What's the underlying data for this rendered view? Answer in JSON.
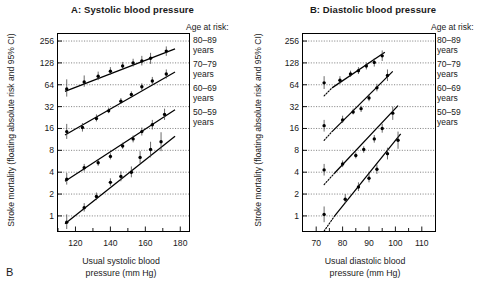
{
  "figure": {
    "corner_label": "B",
    "y_axis_title": "Stroke mortality (floating absolute risk and 95% CI)",
    "y_ticks": [
      "1",
      "2",
      "4",
      "8",
      "16",
      "32",
      "64",
      "128",
      "256"
    ],
    "legend_heading": "Age at risk:",
    "legend_entries": [
      {
        "range": "80–89",
        "unit": "years"
      },
      {
        "range": "70–79",
        "unit": "years"
      },
      {
        "range": "60–69",
        "unit": "years"
      },
      {
        "range": "50–59",
        "unit": "years"
      }
    ]
  },
  "panel_a": {
    "title": "A: Systolic blood pressure",
    "x_axis_title_line1": "Usual systolic blood",
    "x_axis_title_line2": "pressure (mm Hg)",
    "x_ticks": [
      "120",
      "140",
      "160",
      "180"
    ]
  },
  "panel_b": {
    "title": "B: Diastolic blood pressure",
    "x_axis_title_line1": "Usual diastolic blood",
    "x_axis_title_line2": "pressure (mm Hg)",
    "x_ticks": [
      "70",
      "80",
      "90",
      "100",
      "110"
    ]
  },
  "chart_data": {
    "type": "scatter",
    "ylabel": "Stroke mortality (floating absolute risk and 95% CI)",
    "y_scale": "log2",
    "ylim": [
      0.62,
      320
    ],
    "y_ticks": [
      1,
      2,
      4,
      8,
      16,
      32,
      64,
      128,
      256
    ],
    "grid": "horizontal-dotted",
    "legend_position": "right-outside",
    "legend_title": "Age at risk:",
    "panels": [
      {
        "id": "A",
        "title": "A: Systolic blood pressure",
        "xlabel": "Usual systolic blood pressure (mm Hg)",
        "xlim": [
          110,
          185
        ],
        "x_ticks": [
          120,
          140,
          160,
          180
        ],
        "x_minor_ticks": [
          110,
          130,
          150,
          170
        ],
        "series": [
          {
            "name": "80–89 years",
            "fit_line": {
              "x0": 114,
              "y0": 52,
              "x1": 177,
              "y1": 200
            },
            "points": [
              {
                "x": 115,
                "y": 56,
                "ci_low": 44,
                "ci_high": 76
              },
              {
                "x": 125,
                "y": 70,
                "ci_low": 60,
                "ci_high": 86
              },
              {
                "x": 133,
                "y": 84,
                "ci_low": 74,
                "ci_high": 97
              },
              {
                "x": 140,
                "y": 98,
                "ci_low": 88,
                "ci_high": 112
              },
              {
                "x": 147,
                "y": 116,
                "ci_low": 104,
                "ci_high": 132
              },
              {
                "x": 153,
                "y": 128,
                "ci_low": 114,
                "ci_high": 146
              },
              {
                "x": 158,
                "y": 136,
                "ci_low": 118,
                "ci_high": 160
              },
              {
                "x": 163,
                "y": 148,
                "ci_low": 124,
                "ci_high": 176
              },
              {
                "x": 172,
                "y": 186,
                "ci_low": 160,
                "ci_high": 216
              }
            ]
          },
          {
            "name": "70–79 years",
            "fit_line": {
              "x0": 114,
              "y0": 13,
              "x1": 177,
              "y1": 96
            },
            "points": [
              {
                "x": 115,
                "y": 14.5,
                "ci_low": 11.5,
                "ci_high": 18.5
              },
              {
                "x": 124,
                "y": 16.5,
                "ci_low": 14.5,
                "ci_high": 19
              },
              {
                "x": 132,
                "y": 22,
                "ci_low": 20,
                "ci_high": 25
              },
              {
                "x": 139,
                "y": 28,
                "ci_low": 26,
                "ci_high": 31
              },
              {
                "x": 146,
                "y": 38,
                "ci_low": 35,
                "ci_high": 42
              },
              {
                "x": 152,
                "y": 47,
                "ci_low": 43,
                "ci_high": 52
              },
              {
                "x": 158,
                "y": 60,
                "ci_low": 54,
                "ci_high": 67
              },
              {
                "x": 164,
                "y": 72,
                "ci_low": 64,
                "ci_high": 82
              },
              {
                "x": 172,
                "y": 90,
                "ci_low": 78,
                "ci_high": 104
              }
            ]
          },
          {
            "name": "60–69 years",
            "fit_line": {
              "x0": 114,
              "y0": 3.0,
              "x1": 177,
              "y1": 29
            },
            "points": [
              {
                "x": 115,
                "y": 3.2,
                "ci_low": 2.7,
                "ci_high": 3.9
              },
              {
                "x": 125,
                "y": 4.6,
                "ci_low": 4.1,
                "ci_high": 5.2
              },
              {
                "x": 133,
                "y": 5.4,
                "ci_low": 4.9,
                "ci_high": 6.0
              },
              {
                "x": 140,
                "y": 6.6,
                "ci_low": 6.0,
                "ci_high": 7.3
              },
              {
                "x": 147,
                "y": 9.2,
                "ci_low": 8.4,
                "ci_high": 10.2
              },
              {
                "x": 153,
                "y": 11.5,
                "ci_low": 10.3,
                "ci_high": 12.8
              },
              {
                "x": 158,
                "y": 14.5,
                "ci_low": 12.8,
                "ci_high": 16.5
              },
              {
                "x": 164,
                "y": 18,
                "ci_low": 15.5,
                "ci_high": 21
              },
              {
                "x": 171,
                "y": 25,
                "ci_low": 21,
                "ci_high": 30
              }
            ]
          },
          {
            "name": "50–59 years",
            "fit_line": {
              "x0": 114,
              "y0": 0.78,
              "x1": 177,
              "y1": 12.5
            },
            "points": [
              {
                "x": 115,
                "y": 0.82,
                "ci_low": 0.66,
                "ci_high": 1.05
              },
              {
                "x": 125,
                "y": 1.3,
                "ci_low": 1.15,
                "ci_high": 1.5
              },
              {
                "x": 132,
                "y": 1.85,
                "ci_low": 1.65,
                "ci_high": 2.1
              },
              {
                "x": 140,
                "y": 2.9,
                "ci_low": 2.6,
                "ci_high": 3.3
              },
              {
                "x": 146,
                "y": 3.5,
                "ci_low": 3.0,
                "ci_high": 4.1
              },
              {
                "x": 152,
                "y": 4.0,
                "ci_low": 3.4,
                "ci_high": 4.8
              },
              {
                "x": 157,
                "y": 6.4,
                "ci_low": 5.3,
                "ci_high": 7.8
              },
              {
                "x": 163,
                "y": 8.2,
                "ci_low": 6.4,
                "ci_high": 10.5
              },
              {
                "x": 169,
                "y": 10.5,
                "ci_low": 7.8,
                "ci_high": 14.2
              }
            ]
          }
        ]
      },
      {
        "id": "B",
        "title": "B: Diastolic blood pressure",
        "xlabel": "Usual diastolic blood pressure (mm Hg)",
        "xlim": [
          65,
          115
        ],
        "x_ticks": [
          70,
          80,
          90,
          100,
          110
        ],
        "x_minor_ticks": [
          75,
          85,
          95,
          105
        ],
        "series": [
          {
            "name": "80–89 years",
            "fit_line": {
              "x0": 76,
              "y0": 58,
              "x1": 96,
              "y1": 180
            },
            "dotted_extension": {
              "x0": 73,
              "y0": 45,
              "x1": 76,
              "y1": 58
            },
            "points": [
              {
                "x": 73,
                "y": 68,
                "ci_low": 56,
                "ci_high": 84
              },
              {
                "x": 79,
                "y": 74,
                "ci_low": 66,
                "ci_high": 84
              },
              {
                "x": 83,
                "y": 90,
                "ci_low": 82,
                "ci_high": 100
              },
              {
                "x": 86,
                "y": 100,
                "ci_low": 90,
                "ci_high": 112
              },
              {
                "x": 89,
                "y": 116,
                "ci_low": 104,
                "ci_high": 130
              },
              {
                "x": 92,
                "y": 130,
                "ci_low": 114,
                "ci_high": 148
              },
              {
                "x": 95,
                "y": 160,
                "ci_low": 136,
                "ci_high": 190
              }
            ]
          },
          {
            "name": "70–79 years",
            "fit_line": {
              "x0": 76,
              "y0": 14.5,
              "x1": 99,
              "y1": 98
            },
            "dotted_extension": {
              "x0": 73,
              "y0": 11,
              "x1": 76,
              "y1": 14.5
            },
            "points": [
              {
                "x": 73,
                "y": 17.5,
                "ci_low": 14.5,
                "ci_high": 21
              },
              {
                "x": 80,
                "y": 21,
                "ci_low": 19,
                "ci_high": 24
              },
              {
                "x": 84,
                "y": 27,
                "ci_low": 25,
                "ci_high": 30
              },
              {
                "x": 87,
                "y": 30,
                "ci_low": 27,
                "ci_high": 33
              },
              {
                "x": 90,
                "y": 42,
                "ci_low": 38,
                "ci_high": 47
              },
              {
                "x": 93,
                "y": 58,
                "ci_low": 52,
                "ci_high": 66
              },
              {
                "x": 97,
                "y": 86,
                "ci_low": 72,
                "ci_high": 104
              }
            ]
          },
          {
            "name": "60–69 years",
            "fit_line": {
              "x0": 77,
              "y0": 3.9,
              "x1": 101,
              "y1": 33
            },
            "dotted_extension": {
              "x0": 73,
              "y0": 2.7,
              "x1": 77,
              "y1": 3.9
            },
            "points": [
              {
                "x": 73,
                "y": 4.3,
                "ci_low": 3.6,
                "ci_high": 5.2
              },
              {
                "x": 80,
                "y": 5.2,
                "ci_low": 4.7,
                "ci_high": 5.8
              },
              {
                "x": 85,
                "y": 6.8,
                "ci_low": 6.2,
                "ci_high": 7.5
              },
              {
                "x": 88,
                "y": 8.2,
                "ci_low": 7.4,
                "ci_high": 9.1
              },
              {
                "x": 92,
                "y": 11.5,
                "ci_low": 10.2,
                "ci_high": 13
              },
              {
                "x": 95,
                "y": 16,
                "ci_low": 14,
                "ci_high": 18.5
              },
              {
                "x": 99,
                "y": 26,
                "ci_low": 21,
                "ci_high": 32
              }
            ]
          },
          {
            "name": "50–59 years",
            "fit_line": {
              "x0": 77,
              "y0": 1.0,
              "x1": 102,
              "y1": 13.5
            },
            "dotted_extension": {
              "x0": 73,
              "y0": 0.62,
              "x1": 77,
              "y1": 1.0
            },
            "points": [
              {
                "x": 73,
                "y": 1.05,
                "ci_low": 0.82,
                "ci_high": 1.35
              },
              {
                "x": 81,
                "y": 1.7,
                "ci_low": 1.5,
                "ci_high": 2.0
              },
              {
                "x": 86,
                "y": 2.5,
                "ci_low": 2.2,
                "ci_high": 2.9
              },
              {
                "x": 90,
                "y": 3.3,
                "ci_low": 2.9,
                "ci_high": 3.8
              },
              {
                "x": 93,
                "y": 4.4,
                "ci_low": 3.8,
                "ci_high": 5.1
              },
              {
                "x": 97,
                "y": 7.2,
                "ci_low": 6.0,
                "ci_high": 8.7
              },
              {
                "x": 101,
                "y": 11,
                "ci_low": 8.4,
                "ci_high": 14.5
              }
            ]
          }
        ]
      }
    ]
  }
}
